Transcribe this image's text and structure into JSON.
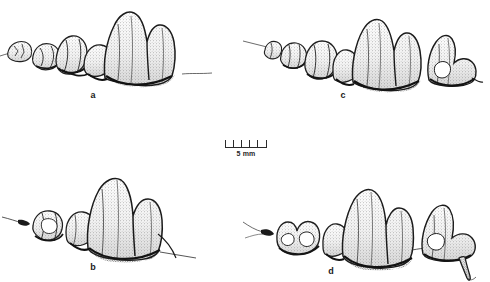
{
  "figure": {
    "type": "scientific-illustration",
    "technique": "stippled pen-and-ink line drawing",
    "background_color": "#ffffff",
    "ink_color": "#1a1a1a",
    "width_px": 490,
    "height_px": 282
  },
  "scale_bar": {
    "label": "5 mm",
    "divisions": 5,
    "tick_count": 6,
    "length_px": 42,
    "position": "center"
  },
  "panels": [
    {
      "id": "a",
      "label": "a",
      "position": "top-left",
      "tooth_count": 4,
      "description": "Upper cheek-tooth row: three small anterior premolars increasing in size, followed by one very large carnassial with two tall cusps and a low anterior cingulum; alveolar border drawn as dark line, fine hair-line extends beyond both ends.",
      "has_detached_tooth": false,
      "largest_tooth": "carnassial with two tall cusps"
    },
    {
      "id": "b",
      "label": "b",
      "position": "bottom-left",
      "tooth_count": 3,
      "description": "Upper cheek-tooth row: two small anterior premolars, then a large carnassial with one dominant tall cusp and one lower posterior cusp; tooth row set lower, hair-line projects at left.",
      "has_detached_tooth": false,
      "largest_tooth": "carnassial with one dominant tall cusp"
    },
    {
      "id": "c",
      "label": "c",
      "position": "top-right",
      "tooth_count": 5,
      "description": "Upper cheek-tooth row: three small anterior premolars, a large two-cusped carnassial, plus a separate posterior molar drawn slightly apart at right.",
      "has_detached_tooth": true,
      "largest_tooth": "two-cusped carnassial"
    },
    {
      "id": "d",
      "label": "d",
      "position": "bottom-right",
      "tooth_count": 4,
      "description": "Upper cheek-tooth row: one broad multicusped anterior tooth, a large two-cusped carnassial, plus a separate posterior molar at right showing an exposed elongate root.",
      "has_detached_tooth": true,
      "largest_tooth": "two-cusped carnassial"
    }
  ]
}
